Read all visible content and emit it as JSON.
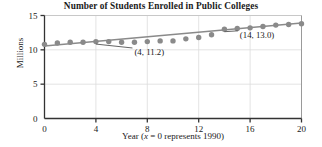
{
  "chart_data": {
    "type": "scatter",
    "title": "Number of Students Enrolled in Public Colleges",
    "xlabel_parts": {
      "lead": "Year (",
      "italic_var": "x",
      "tail": " = 0 represents 1990)"
    },
    "xlabel": "Year (x = 0 represents 1990)",
    "ylabel": "Millions",
    "xlim": [
      0,
      20
    ],
    "ylim": [
      0,
      15
    ],
    "xticks": [
      0,
      4,
      8,
      12,
      16,
      20
    ],
    "yticks": [
      0,
      5,
      10,
      15
    ],
    "xtick_labels": [
      "0",
      "4",
      "8",
      "12",
      "16",
      "20"
    ],
    "ytick_labels": [
      "0",
      "5",
      "10",
      "15"
    ],
    "grid": true,
    "grid_color": "#dcdcdc",
    "legend": null,
    "marker_color": "#8a8a8a",
    "line_color": "#8a8a8a",
    "x": [
      0,
      1,
      2,
      3,
      4,
      5,
      6,
      7,
      8,
      9,
      10,
      11,
      12,
      13,
      14,
      15,
      16,
      17,
      18,
      19,
      20
    ],
    "values": [
      10.8,
      11.0,
      11.1,
      11.1,
      11.2,
      11.2,
      11.1,
      11.1,
      11.2,
      11.3,
      11.3,
      11.6,
      11.8,
      12.2,
      13.0,
      13.1,
      13.2,
      13.4,
      13.6,
      13.7,
      13.8
    ],
    "series": [
      {
        "name": "Students enrolled (millions)",
        "values": [
          10.8,
          11.0,
          11.1,
          11.1,
          11.2,
          11.2,
          11.1,
          11.1,
          11.2,
          11.3,
          11.3,
          11.6,
          11.8,
          12.2,
          13.0,
          13.1,
          13.2,
          13.4,
          13.6,
          13.7,
          13.8
        ]
      }
    ],
    "trendline": {
      "type": "linear",
      "x_start": 0,
      "y_start": 10.55,
      "x_end": 20,
      "y_end": 13.9
    },
    "annotations": [
      {
        "label": "(4, 11.2)",
        "point_x": 4,
        "point_y": 11.2,
        "text_x": 7.0,
        "text_y": 9.25
      },
      {
        "label": "(14, 13.0)",
        "point_x": 14,
        "point_y": 13.0,
        "text_x": 15.2,
        "text_y": 11.75
      }
    ]
  }
}
